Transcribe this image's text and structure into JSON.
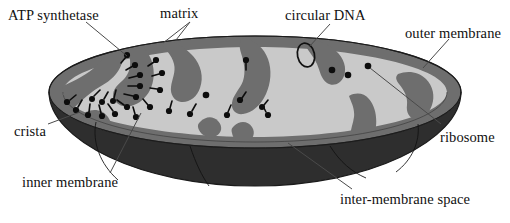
{
  "figure": {
    "width": 510,
    "height": 223,
    "background": "#ffffff"
  },
  "palette": {
    "background": "#ffffff",
    "matrix": "#c9c9c9",
    "cristae": "#6e6e6e",
    "outer_membrane_rim": "#5e5e5e",
    "inner_bowl": "#2e2e2e",
    "ribosome": "#0d0d0d",
    "atp_synthetase": "#0d0d0d",
    "dna_outline": "#111111",
    "leader_line": "#4a4a4a",
    "label_text": "#111111"
  },
  "labels": {
    "atp_synthetase": "ATP synthetase",
    "matrix": "matrix",
    "circular_dna": "circular DNA",
    "outer_membrane": "outer membrane",
    "crista": "crista",
    "ribosome": "ribosome",
    "inner_membrane": "inner membrane",
    "inter_membrane_space": "inter-membrane space"
  },
  "structures": {
    "atp_synthetase_count": 26,
    "ribosome_count": 4,
    "circular_dna_count": 1,
    "crista_count": 7
  }
}
